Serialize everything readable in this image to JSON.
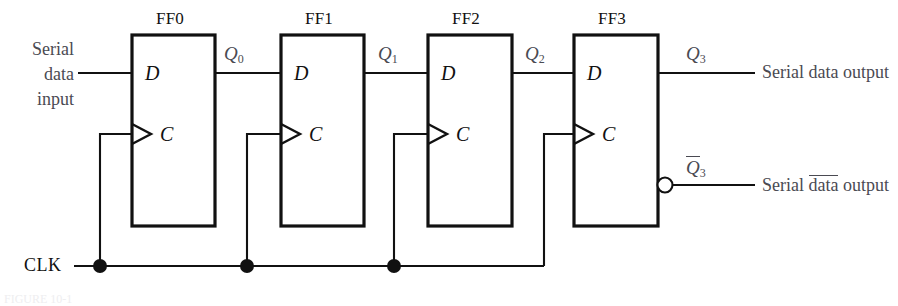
{
  "figure": {
    "title_caption": "FIGURE 10-1",
    "clock_label": "CLK"
  },
  "flipflops": [
    {
      "name": "FF0",
      "d_pin": "D",
      "c_pin": "C",
      "output_label": "Q",
      "output_sub": "0"
    },
    {
      "name": "FF1",
      "d_pin": "D",
      "c_pin": "C",
      "output_label": "Q",
      "output_sub": "1"
    },
    {
      "name": "FF2",
      "d_pin": "D",
      "c_pin": "C",
      "output_label": "Q",
      "output_sub": "2"
    },
    {
      "name": "FF3",
      "d_pin": "D",
      "c_pin": "C",
      "output_label": "Q",
      "output_sub": "3"
    }
  ],
  "io": {
    "input_line1": "Serial",
    "input_line2": "data",
    "input_line3": "input",
    "output_q3_label": "Q",
    "output_q3_sub": "3",
    "output_q3_text": "Serial data output",
    "output_qnot3_label": "Q",
    "output_qnot3_sub": "3",
    "output_qnot3_text_pre": "Serial ",
    "output_qnot3_text_bar": "data",
    "output_qnot3_text_post": " output"
  },
  "colors": {
    "wire": "#111111",
    "box_stroke": "#111111",
    "label_gray": "#4a4a52",
    "background": "#ffffff"
  }
}
